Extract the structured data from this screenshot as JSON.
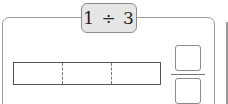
{
  "problem": {
    "expression": "1 ÷ 3",
    "dividend": 1,
    "divisor": 3
  },
  "bar_model": {
    "segments": 3,
    "segment_style": "dashed-dividers"
  },
  "answer_fraction": {
    "numerator": "",
    "denominator": ""
  },
  "colors": {
    "pill_background": "#e6e6e6",
    "border": "#9a9a9a"
  }
}
